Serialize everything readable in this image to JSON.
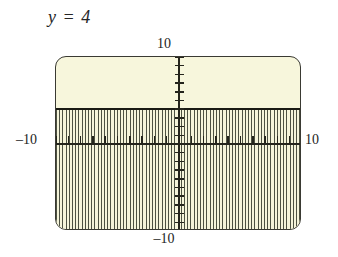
{
  "caption": {
    "equation": "y = 4"
  },
  "axis_labels": {
    "y_max": "10",
    "y_min": "–10",
    "x_min": "–10",
    "x_max": "10"
  },
  "colors": {
    "screen_background": "#f7f6dc",
    "frame_border": "#3a3a33",
    "axis": "#24241c",
    "boundary_line": "#1a1a14",
    "hatch": "#4d5142",
    "text": "#1d1d1d"
  },
  "chart_data": {
    "type": "line",
    "title": "y = 4",
    "xlabel": "",
    "ylabel": "",
    "xlim": [
      -10,
      10
    ],
    "ylim": [
      -10,
      10
    ],
    "x_tick_step": 1,
    "y_tick_step": 1,
    "grid": false,
    "legend": "none",
    "series": [
      {
        "name": "y = 4",
        "kind": "horizontal-line",
        "style": "solid-bold",
        "y": 4,
        "x": [
          -10,
          10
        ],
        "values": [
          4,
          4
        ]
      }
    ],
    "shaded_region": {
      "description": "vertical hatching below the line y = 4",
      "inequality": "y ≤ 4",
      "y_from": -10,
      "y_to": 4,
      "pattern": "vertical-lines"
    },
    "annotations": [
      {
        "text": "10",
        "position": "top-of-y-axis",
        "value": 10
      },
      {
        "text": "–10",
        "position": "bottom-of-y-axis",
        "value": -10
      },
      {
        "text": "–10",
        "position": "left-of-x-axis",
        "value": -10
      },
      {
        "text": "10",
        "position": "right-of-x-axis",
        "value": 10
      }
    ]
  }
}
